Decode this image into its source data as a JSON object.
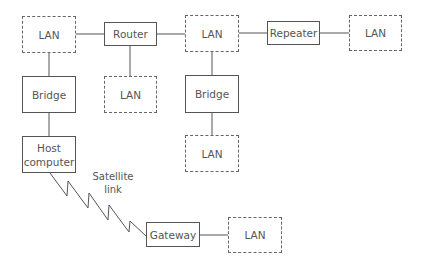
{
  "diagram": {
    "type": "network-topology",
    "nodes": {
      "lan_top_left": {
        "label": "LAN",
        "style": "dashed"
      },
      "router": {
        "label": "Router",
        "style": "solid"
      },
      "lan_top_middle": {
        "label": "LAN",
        "style": "dashed"
      },
      "repeater": {
        "label": "Repeater",
        "style": "solid"
      },
      "lan_top_right": {
        "label": "LAN",
        "style": "dashed"
      },
      "bridge_left": {
        "label": "Bridge",
        "style": "solid"
      },
      "lan_under_router": {
        "label": "LAN",
        "style": "dashed"
      },
      "bridge_middle": {
        "label": "Bridge",
        "style": "solid"
      },
      "lan_under_bridge": {
        "label": "LAN",
        "style": "dashed"
      },
      "host_computer": {
        "label_line1": "Host",
        "label_line2": "computer",
        "style": "solid"
      },
      "gateway": {
        "label": "Gateway",
        "style": "solid"
      },
      "lan_bottom": {
        "label": "LAN",
        "style": "dashed"
      }
    },
    "satellite_link": {
      "label_line1": "Satellite",
      "label_line2": "link"
    },
    "edges": [
      [
        "lan_top_left",
        "router"
      ],
      [
        "router",
        "lan_top_middle"
      ],
      [
        "lan_top_middle",
        "repeater"
      ],
      [
        "repeater",
        "lan_top_right"
      ],
      [
        "router",
        "lan_under_router"
      ],
      [
        "lan_top_left",
        "bridge_left"
      ],
      [
        "bridge_left",
        "host_computer"
      ],
      [
        "lan_top_middle",
        "bridge_middle"
      ],
      [
        "bridge_middle",
        "lan_under_bridge"
      ],
      [
        "host_computer",
        "gateway",
        "satellite-link"
      ],
      [
        "gateway",
        "lan_bottom"
      ]
    ],
    "colors": {
      "line": "#555555",
      "text": "#555555"
    }
  }
}
